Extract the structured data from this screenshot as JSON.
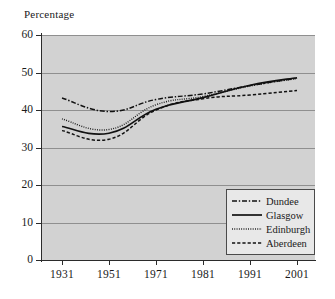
{
  "chart_data": {
    "type": "line",
    "title": "Percentage",
    "xlabel": "",
    "ylabel": "Percentage",
    "categories": [
      "1931",
      "1951",
      "1971",
      "1981",
      "1991",
      "2001"
    ],
    "x": [
      "1931",
      "1951",
      "1971",
      "1981",
      "1991",
      "2001"
    ],
    "yticks": [
      "0",
      "10",
      "20",
      "30",
      "40",
      "50",
      "60"
    ],
    "ytick_values": [
      0,
      10,
      20,
      30,
      40,
      50,
      60
    ],
    "ylim": [
      0,
      60
    ],
    "grid": true,
    "legend_position": "lower-right",
    "series": [
      {
        "name": "Dundee",
        "style": "dash-dot",
        "values": [
          43.2,
          39.6,
          42.8,
          44.3,
          46.5,
          48.5
        ]
      },
      {
        "name": "Glasgow",
        "style": "solid",
        "values": [
          35.6,
          33.8,
          40.2,
          43.3,
          46.6,
          48.6
        ]
      },
      {
        "name": "Edinburgh",
        "style": "dotted",
        "values": [
          37.6,
          34.8,
          41.4,
          43.6,
          46.4,
          48.4
        ]
      },
      {
        "name": "Aberdeen",
        "style": "dashed",
        "values": [
          34.5,
          32.2,
          40.0,
          43.0,
          44.0,
          45.2
        ]
      }
    ]
  },
  "colors": {
    "plot_background": "#d2d2d2",
    "gridline": "#8f8f8f",
    "axis": "#2b2b2b",
    "series": "#111111",
    "legend_background": "#e8e8e8",
    "legend_border": "#4a4a4a",
    "page_background": "#ffffff"
  }
}
